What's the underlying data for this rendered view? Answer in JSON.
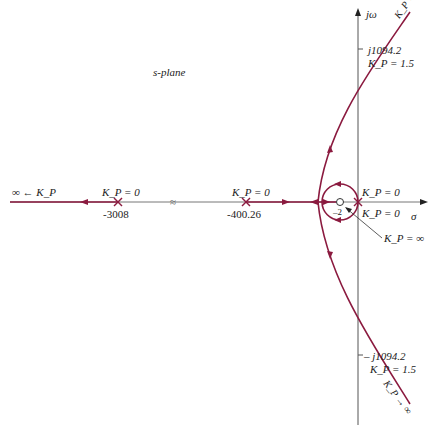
{
  "diagram": {
    "title": "s-plane",
    "type": "root-locus",
    "colors": {
      "locus": "#8b1a3f",
      "axis": "#555555",
      "text": "#222222"
    },
    "axes": {
      "imag_label": "jω",
      "real_label": "σ"
    },
    "poles": [
      {
        "value": "-3008",
        "gain_label": "K_P = 0"
      },
      {
        "value": "-400.26",
        "gain_label": "K_P = 0"
      },
      {
        "value": "0",
        "gain_label": "K_P = 0",
        "note": "double pole at origin"
      }
    ],
    "zeros": [
      {
        "value": "-2"
      }
    ],
    "labels": {
      "left_infinity": "∞ ← K_P",
      "upper_crossing": "j1094.2",
      "upper_gain": "K_P = 1.5",
      "lower_crossing": "– j1094.2",
      "lower_gain": "K_P = 1.5",
      "zero_gain": "K_P = ∞",
      "upper_asymptote": "K_P → ∞",
      "lower_asymptote": "K_P → ∞",
      "origin_gain_top": "K_P = 0",
      "origin_gain_bottom": "K_P = 0",
      "zero_value": "–2",
      "axis_break": "≈"
    }
  }
}
